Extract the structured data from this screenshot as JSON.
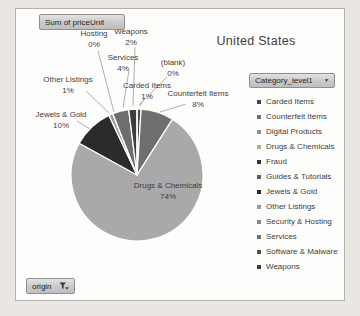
{
  "window": {
    "background": "#eae7e3",
    "plot_background": "#fdfdfc"
  },
  "header": {
    "title": "United States"
  },
  "field_buttons": {
    "value_button_label": "Sum of priceUnit",
    "legend_button_label": "Category_level1",
    "axis_button_label": "origin"
  },
  "legend": {
    "position": "right",
    "items": [
      {
        "label": "Carded Items",
        "color": "#464646"
      },
      {
        "label": "Counterfeit Items",
        "color": "#6f6f6f"
      },
      {
        "label": "Digital Products",
        "color": "#8f8f8f"
      },
      {
        "label": "Drugs & Chemicals",
        "color": "#a9a9a9"
      },
      {
        "label": "Fraud",
        "color": "#343434"
      },
      {
        "label": "Guides & Tutorials",
        "color": "#5c5c5c"
      },
      {
        "label": "Jewels & Gold",
        "color": "#2b2b2b"
      },
      {
        "label": "Other Listings",
        "color": "#9b9b9b"
      },
      {
        "label": "Security & Hosting",
        "color": "#868686"
      },
      {
        "label": "Services",
        "color": "#6e6e6e"
      },
      {
        "label": "Software & Malware",
        "color": "#4f4f4f"
      },
      {
        "label": "Weapons",
        "color": "#3d3d3d"
      }
    ]
  },
  "chart_data": {
    "type": "pie",
    "title": "United States",
    "value_field": "Sum of priceUnit",
    "category_field": "Category_level1",
    "filter_field": "origin",
    "start_angle_deg": 0,
    "direction": "clockwise",
    "slices": [
      {
        "name": "Carded Items",
        "pct": 1,
        "color": "#464646",
        "label_lines": [
          "Carded Items",
          "1%"
        ]
      },
      {
        "name": "Counterfeit Items",
        "pct": 8,
        "color": "#6f6f6f",
        "label_lines": [
          "Counterfeit Items",
          "8%"
        ]
      },
      {
        "name": "Drugs & Chemicals",
        "pct": 74,
        "color": "#a9a9a9",
        "label_lines": [
          "Drugs & Chemicals",
          "74%"
        ]
      },
      {
        "name": "Jewels & Gold",
        "pct": 10,
        "color": "#2b2b2b",
        "label_lines": [
          "Jewels & Gold",
          "10%"
        ]
      },
      {
        "name": "Other Listings",
        "pct": 1,
        "color": "#9b9b9b",
        "label_lines": [
          "Other Listings",
          "1%"
        ]
      },
      {
        "name": "Security & Hosting",
        "pct": 0,
        "color": "#868686",
        "label_lines": [
          "Security &",
          "Hosting",
          "0%"
        ]
      },
      {
        "name": "Services",
        "pct": 4,
        "color": "#6e6e6e",
        "label_lines": [
          "Services",
          "4%"
        ]
      },
      {
        "name": "Weapons",
        "pct": 2,
        "color": "#3d3d3d",
        "label_lines": [
          "Weapons",
          "2%"
        ]
      },
      {
        "name": "(blank)",
        "pct": 0,
        "color": "#555555",
        "label_lines": [
          "(blank)",
          "0%"
        ]
      }
    ]
  }
}
